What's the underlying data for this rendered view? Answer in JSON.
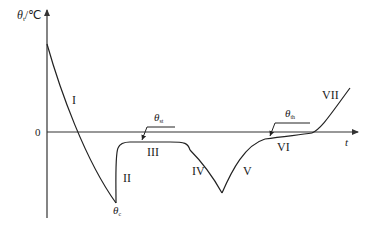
{
  "diagram": {
    "type": "temperature-time curve",
    "y_axis": {
      "symbol": "θ",
      "subscript": "t",
      "unit": "/℃"
    },
    "x_axis": {
      "label": "t"
    },
    "zero_label": "0",
    "stages": [
      {
        "id": "I",
        "label": "I"
      },
      {
        "id": "II",
        "label": "II"
      },
      {
        "id": "III",
        "label": "III"
      },
      {
        "id": "IV",
        "label": "IV"
      },
      {
        "id": "V",
        "label": "V"
      },
      {
        "id": "VI",
        "label": "VI"
      },
      {
        "id": "VII",
        "label": "VII"
      }
    ],
    "annotations": {
      "theta_c": {
        "symbol": "θ",
        "subscript": "c"
      },
      "theta_st": {
        "symbol": "θ",
        "subscript": "st"
      },
      "theta_th": {
        "symbol": "θ",
        "subscript": "th"
      }
    },
    "colors": {
      "line": "#222222",
      "axis": "#333333"
    }
  }
}
